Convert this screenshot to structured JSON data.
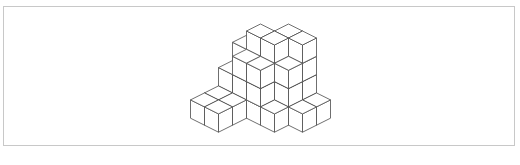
{
  "figure": {
    "colors": {
      "stroke": "#4a4a4a",
      "face": "#ffffff",
      "frame": "#c8c8c8"
    },
    "projection": {
      "origin_x": 274.5,
      "origin_y": 48.2,
      "half_width": 14,
      "diag_rise": 7,
      "cube_height": 18.3
    },
    "columns": [
      {
        "a": 4,
        "b": 3,
        "height": 4
      },
      {
        "a": 5,
        "b": 3,
        "height": 4
      },
      {
        "a": 6,
        "b": 3,
        "height": 1
      },
      {
        "a": 2,
        "b": 4,
        "height": 3
      },
      {
        "a": 3,
        "b": 4,
        "height": 4
      },
      {
        "a": 4,
        "b": 4,
        "height": 4
      },
      {
        "a": 5,
        "b": 4,
        "height": 3
      },
      {
        "a": 6,
        "b": 4,
        "height": 1
      },
      {
        "a": 2,
        "b": 5,
        "height": 2
      },
      {
        "a": 3,
        "b": 5,
        "height": 3
      },
      {
        "a": 4,
        "b": 5,
        "height": 3
      },
      {
        "a": 5,
        "b": 5,
        "height": 1
      },
      {
        "a": 2,
        "b": 6,
        "height": 1
      },
      {
        "a": 3,
        "b": 6,
        "height": 1
      },
      {
        "a": 2,
        "b": 7,
        "height": 1
      },
      {
        "a": 3,
        "b": 7,
        "height": 1
      }
    ]
  }
}
